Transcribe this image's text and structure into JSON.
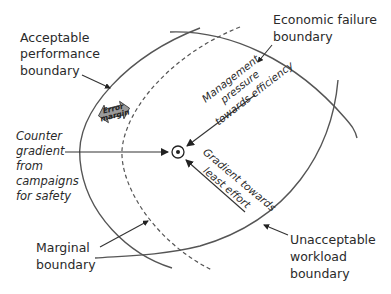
{
  "diagram": {
    "boundaries": {
      "acceptable_performance": {
        "lines": [
          "Acceptable",
          "performance",
          "boundary"
        ]
      },
      "economic_failure": {
        "lines": [
          "Economic failure",
          "boundary"
        ]
      },
      "unacceptable_workload": {
        "lines": [
          "Unacceptable",
          "workload",
          "boundary"
        ]
      },
      "marginal": {
        "lines": [
          "Marginal",
          "boundary"
        ]
      }
    },
    "error_margin": {
      "lines": [
        "Error",
        "margin"
      ]
    },
    "forces": {
      "management_pressure": {
        "lines": [
          "Management",
          "pressure",
          "towards efficiency"
        ]
      },
      "least_effort": {
        "lines": [
          "Gradient towards",
          "least effort"
        ]
      },
      "counter_gradient": {
        "lines": [
          "Counter",
          "gradient",
          "from",
          "campaigns",
          "for safety"
        ]
      }
    },
    "operating_point": {
      "icon": "circled-dot"
    },
    "colors": {
      "line": "#555555",
      "text": "#2a2a2a",
      "error_margin_fill": "#9a9a9a",
      "background": "#ffffff"
    }
  }
}
